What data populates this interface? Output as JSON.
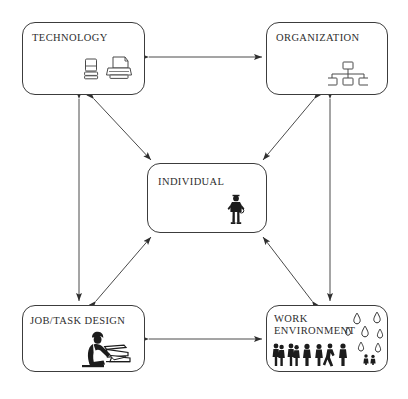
{
  "diagram": {
    "background_color": "#ffffff",
    "line_color": "#3c3c3c",
    "text_color": "#2e2e2e",
    "nodes": [
      {
        "id": "technology",
        "label": "TECHNOLOGY",
        "icons": [
          "computer-icon",
          "printer-icon"
        ]
      },
      {
        "id": "organization",
        "label": "ORGANIZATION",
        "icons": [
          "org-chart-icon"
        ]
      },
      {
        "id": "individual",
        "label": "INDIVIDUAL",
        "icons": [
          "person-icon"
        ]
      },
      {
        "id": "job_task_design",
        "label": "JOB/TASK DESIGN",
        "icons": [
          "seated-worker-icon"
        ]
      },
      {
        "id": "work_environment",
        "label": "WORK\nENVIRONMENT",
        "icons": [
          "crowd-icon",
          "rain-drops-icon"
        ]
      }
    ],
    "connections": [
      {
        "from": "technology",
        "to": "organization",
        "style": "double-headed-arrow",
        "orientation": "horizontal"
      },
      {
        "from": "job_task_design",
        "to": "work_environment",
        "style": "double-headed-arrow",
        "orientation": "horizontal"
      },
      {
        "from": "technology",
        "to": "job_task_design",
        "style": "double-headed-arrow",
        "orientation": "vertical"
      },
      {
        "from": "organization",
        "to": "work_environment",
        "style": "double-headed-arrow",
        "orientation": "vertical"
      },
      {
        "from": "technology",
        "to": "individual",
        "style": "double-headed-arrow",
        "orientation": "diagonal"
      },
      {
        "from": "organization",
        "to": "individual",
        "style": "double-headed-arrow",
        "orientation": "diagonal"
      },
      {
        "from": "job_task_design",
        "to": "individual",
        "style": "double-headed-arrow",
        "orientation": "diagonal"
      },
      {
        "from": "work_environment",
        "to": "individual",
        "style": "double-headed-arrow",
        "orientation": "diagonal"
      }
    ]
  }
}
